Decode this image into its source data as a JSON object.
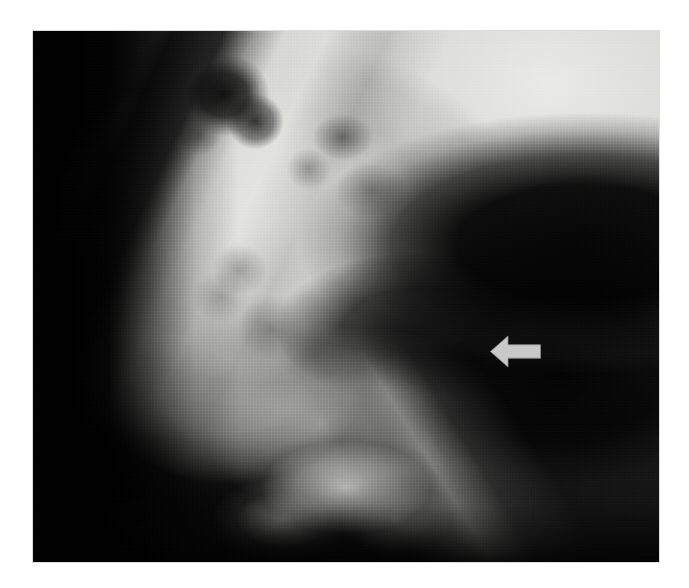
{
  "image": {
    "kind": "radiograph",
    "modality": "plain-film-radiograph",
    "view": "lateral",
    "orientation": "left-lateral",
    "render": "grayscale halftone print reproduction",
    "caption_text": "",
    "page_background_color": "#ffffff",
    "plate": {
      "left": 33,
      "top": 31,
      "width": 626,
      "height": 531,
      "border_color": "#dcdcdc",
      "darkest_color": "#000000",
      "brightest_color": "#f2f2f0"
    }
  },
  "annotations": [
    {
      "id": "arrow-1",
      "type": "arrow",
      "label": "",
      "direction": "left",
      "color": "#c9c9c9",
      "outline_color": "#8e8e8e",
      "x": 486,
      "y": 332,
      "width": 58,
      "height": 38,
      "tip_x": 490,
      "tip_y": 351,
      "points_at": "bright cortical bone line at posterior margin"
    }
  ],
  "regions": [
    {
      "name": "dark-background-left-column",
      "tone": "black"
    },
    {
      "name": "bright-petrous-mastoid-mass",
      "tone": "bright"
    },
    {
      "name": "air-cell-lucency-upper",
      "tone": "dark"
    },
    {
      "name": "zygomatic-arch-band",
      "tone": "bright"
    },
    {
      "name": "glenoid-fossa-dark-wedge",
      "tone": "black"
    },
    {
      "name": "soft-tissue-fog-upper-right",
      "tone": "very-bright"
    },
    {
      "name": "cortical-line-indicated",
      "tone": "bright"
    },
    {
      "name": "mandibular-body-lower",
      "tone": "bright"
    }
  ],
  "text_elements": []
}
